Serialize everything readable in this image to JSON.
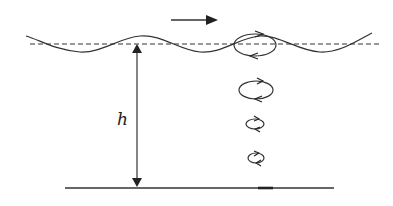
{
  "diagram": {
    "type": "water-wave-orbital-motion",
    "labels": {
      "depth": "h"
    },
    "elements": {
      "wave_direction_arrow": "rightward arrow above surface",
      "mean_water_level": "dashed line",
      "free_surface": "sinusoidal wave",
      "depth_arrow": "double-headed vertical arrow from surface to bed",
      "seabed": "solid horizontal line",
      "orbits": [
        {
          "cx": 255,
          "cy": 46,
          "rx": 20,
          "ry": 11,
          "note": "surface orbit"
        },
        {
          "cx": 256,
          "cy": 90,
          "rx": 16,
          "ry": 9
        },
        {
          "cx": 256,
          "cy": 125,
          "rx": 9,
          "ry": 5
        },
        {
          "cx": 256,
          "cy": 158,
          "rx": 8,
          "ry": 5
        }
      ]
    },
    "colors": {
      "stroke": "#333333",
      "background": "#ffffff"
    }
  }
}
